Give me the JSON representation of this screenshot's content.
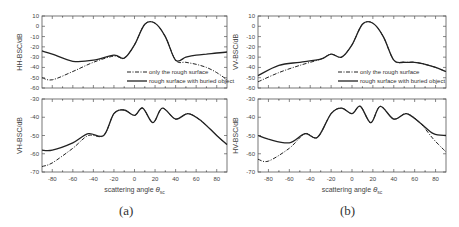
{
  "figure": {
    "panels": [
      {
        "id": "a",
        "caption": "(a)"
      },
      {
        "id": "b",
        "caption": "(b)"
      }
    ],
    "xlabel": "scattering angle θsc",
    "legend": [
      "only the rough surface",
      "rough surface with buried object"
    ]
  },
  "chart_data": [
    {
      "type": "line",
      "panel": "a-top",
      "ylabel": "HH-BSC/dB",
      "xlabel": "",
      "xlim": [
        -90,
        90
      ],
      "ylim": [
        -60,
        10
      ],
      "yticks": [
        10,
        0,
        -10,
        -20,
        -30,
        -40,
        -50,
        -60
      ],
      "legend": [
        "only the rough surface",
        "rough surface with buried object"
      ],
      "x": [
        -90,
        -80,
        -60,
        -40,
        -20,
        -10,
        0,
        10,
        20,
        30,
        40,
        50,
        60,
        70,
        80,
        90
      ],
      "series": [
        {
          "name": "only the rough surface",
          "values": [
            -50,
            -52,
            -44,
            -35,
            -29,
            -31,
            -18,
            2,
            3,
            -10,
            -33,
            -35,
            -37,
            -40,
            -45,
            -52
          ]
        },
        {
          "name": "rough surface with buried object",
          "values": [
            -24,
            -27,
            -34,
            -33,
            -28,
            -31,
            -18,
            2,
            3,
            -10,
            -33,
            -30,
            -28,
            -27,
            -26,
            -25
          ]
        }
      ]
    },
    {
      "type": "line",
      "panel": "a-bottom",
      "ylabel": "VH-BSC/dB",
      "xlabel": "scattering angle θsc",
      "xlim": [
        -90,
        90
      ],
      "ylim": [
        -70,
        -30
      ],
      "xticks": [
        -80,
        -60,
        -40,
        -20,
        0,
        20,
        40,
        60,
        80
      ],
      "yticks": [
        -30,
        -40,
        -50,
        -60,
        -70
      ],
      "x": [
        -90,
        -80,
        -60,
        -45,
        -30,
        -20,
        -10,
        0,
        8,
        18,
        27,
        40,
        52,
        65,
        80,
        90
      ],
      "series": [
        {
          "name": "only the rough surface",
          "values": [
            -67,
            -65,
            -57,
            -50,
            -50,
            -38,
            -36,
            -39,
            -35,
            -43,
            -35,
            -41,
            -38,
            -42,
            -50,
            -55
          ]
        },
        {
          "name": "rough surface with buried object",
          "values": [
            -58,
            -58,
            -54,
            -49,
            -50,
            -38,
            -36,
            -39,
            -35,
            -43,
            -35,
            -41,
            -38,
            -42,
            -50,
            -55
          ]
        }
      ]
    },
    {
      "type": "line",
      "panel": "b-top",
      "ylabel": "VV-BSC/dB",
      "xlabel": "",
      "xlim": [
        -90,
        90
      ],
      "ylim": [
        -60,
        10
      ],
      "yticks": [
        10,
        0,
        -10,
        -20,
        -30,
        -40,
        -50,
        -60
      ],
      "legend": [
        "only the rough surface",
        "rough surface with buried object"
      ],
      "x": [
        -90,
        -70,
        -50,
        -30,
        -20,
        -10,
        0,
        10,
        20,
        30,
        40,
        50,
        60,
        70,
        80,
        90
      ],
      "series": [
        {
          "name": "only the rough surface",
          "values": [
            -54,
            -45,
            -38,
            -32,
            -27,
            -30,
            -18,
            2,
            3,
            -10,
            -33,
            -35,
            -35,
            -37,
            -40,
            -44
          ]
        },
        {
          "name": "rough surface with buried object",
          "values": [
            -48,
            -38,
            -35,
            -32,
            -27,
            -30,
            -18,
            2,
            3,
            -10,
            -33,
            -35,
            -35,
            -37,
            -40,
            -44
          ]
        }
      ]
    },
    {
      "type": "line",
      "panel": "b-bottom",
      "ylabel": "HV-BSC/dB",
      "xlabel": "scattering angle θsc",
      "xlim": [
        -90,
        90
      ],
      "ylim": [
        -70,
        -30
      ],
      "xticks": [
        -80,
        -60,
        -40,
        -20,
        0,
        20,
        40,
        60,
        80
      ],
      "yticks": [
        -30,
        -40,
        -50,
        -60,
        -70
      ],
      "x": [
        -90,
        -80,
        -60,
        -45,
        -33,
        -20,
        -10,
        0,
        8,
        18,
        27,
        40,
        52,
        65,
        78,
        90
      ],
      "series": [
        {
          "name": "only the rough surface",
          "values": [
            -63,
            -64,
            -57,
            -49,
            -51,
            -38,
            -35,
            -38,
            -34,
            -43,
            -34,
            -41,
            -38,
            -43,
            -52,
            -59
          ]
        },
        {
          "name": "rough surface with buried object",
          "values": [
            -50,
            -52,
            -54,
            -49,
            -51,
            -38,
            -35,
            -38,
            -34,
            -43,
            -34,
            -41,
            -38,
            -43,
            -49,
            -50
          ]
        }
      ]
    }
  ]
}
